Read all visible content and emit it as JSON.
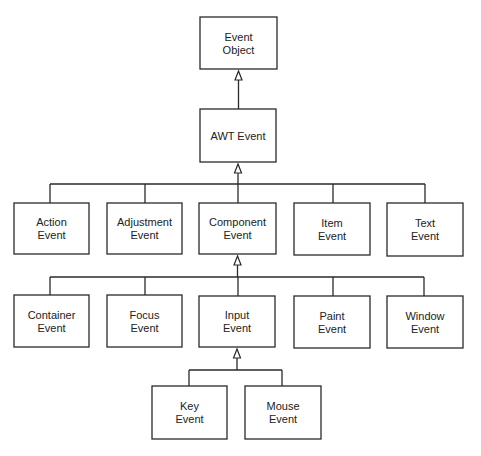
{
  "diagram": {
    "title": "",
    "type": "class-hierarchy",
    "nodes": [
      {
        "id": "event_object",
        "lines": [
          "Event",
          "Object"
        ]
      },
      {
        "id": "awt_event",
        "lines": [
          "AWT Event"
        ]
      },
      {
        "id": "action_event",
        "lines": [
          "Action",
          "Event"
        ]
      },
      {
        "id": "adjustment_event",
        "lines": [
          "Adjustment",
          "Event"
        ]
      },
      {
        "id": "component_event",
        "lines": [
          "Component",
          "Event"
        ]
      },
      {
        "id": "item_event",
        "lines": [
          "Item",
          "Event"
        ]
      },
      {
        "id": "text_event",
        "lines": [
          "Text",
          "Event"
        ]
      },
      {
        "id": "container_event",
        "lines": [
          "Container",
          "Event"
        ]
      },
      {
        "id": "focus_event",
        "lines": [
          "Focus",
          "Event"
        ]
      },
      {
        "id": "input_event",
        "lines": [
          "Input",
          "Event"
        ]
      },
      {
        "id": "paint_event",
        "lines": [
          "Paint",
          "Event"
        ]
      },
      {
        "id": "window_event",
        "lines": [
          "Window",
          "Event"
        ]
      },
      {
        "id": "key_event",
        "lines": [
          "Key",
          "Event"
        ]
      },
      {
        "id": "mouse_event",
        "lines": [
          "Mouse",
          "Event"
        ]
      }
    ],
    "edges": [
      {
        "parent": "event_object",
        "children": [
          "awt_event"
        ]
      },
      {
        "parent": "awt_event",
        "children": [
          "action_event",
          "adjustment_event",
          "component_event",
          "item_event",
          "text_event"
        ]
      },
      {
        "parent": "component_event",
        "children": [
          "container_event",
          "focus_event",
          "input_event",
          "paint_event",
          "window_event"
        ]
      },
      {
        "parent": "input_event",
        "children": [
          "key_event",
          "mouse_event"
        ]
      }
    ],
    "edge_style": "inheritance (hollow triangle arrow pointing to parent)",
    "colors": {
      "stroke": "#2a2a2a",
      "fill": "#ffffff",
      "text": "#222222"
    }
  }
}
